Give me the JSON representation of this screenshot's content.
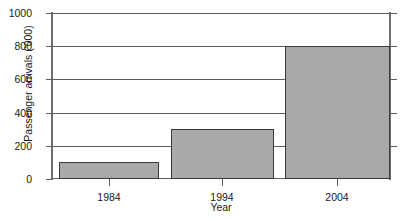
{
  "chart_data": {
    "type": "bar",
    "title": "",
    "subtitle": "",
    "xlabel": "Year",
    "ylabel": "Passenger arrivals ('000)",
    "categories": [
      "1984",
      "1994",
      "2004"
    ],
    "values": [
      100,
      300,
      800
    ],
    "series": [
      {
        "name": "Passenger arrivals",
        "values": [
          100,
          300,
          800
        ]
      }
    ],
    "ylim": [
      0,
      1000
    ],
    "ytick_labels": [
      "0",
      "200",
      "400",
      "600",
      "800",
      "1000"
    ],
    "ytick_values": [
      0,
      200,
      400,
      600,
      800,
      1000
    ],
    "grid": true,
    "grid_axis": "y",
    "legend": false,
    "legend_position": "none",
    "bar_fill_color": "#a9a9a9",
    "bar_edge_color": "#3b3b3b",
    "axis_color": "#5d5d5d",
    "background_color": "#ffffff"
  }
}
